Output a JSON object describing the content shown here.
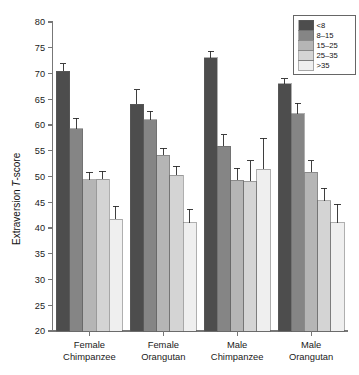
{
  "chart_data": {
    "type": "bar",
    "title": "",
    "subtitle": "",
    "xlabel": "",
    "ylabel": "Extraversion T-score",
    "ylabel_parts": {
      "prefix": "Extraversion ",
      "italic": "T",
      "suffix": "-score"
    },
    "ylim": [
      20,
      80
    ],
    "yticks": [
      20,
      25,
      30,
      35,
      40,
      45,
      50,
      55,
      60,
      65,
      70,
      75,
      80
    ],
    "ytick_labels": [
      "20",
      "25",
      "30",
      "35",
      "40",
      "45",
      "50",
      "55",
      "60",
      "65",
      "70",
      "75",
      "80"
    ],
    "grid": false,
    "legend_position": "top-right",
    "legend_title": "",
    "categories": [
      "Female Chimpanzee",
      "Female Orangutan",
      "Male Chimpanzee",
      "Male Orangutan"
    ],
    "category_lines": [
      [
        "Female",
        "Chimpanzee"
      ],
      [
        "Female",
        "Orangutan"
      ],
      [
        "Male",
        "Chimpanzee"
      ],
      [
        "Male",
        "Orangutan"
      ]
    ],
    "series": [
      {
        "name": "<8",
        "color": "#4d4d4d",
        "values": [
          70.4,
          64.0,
          73.1,
          68.0
        ],
        "err_upper": [
          1.5,
          2.8,
          1.2,
          1.0
        ],
        "err_lower": [
          0.0,
          0.0,
          0.0,
          0.0
        ]
      },
      {
        "name": "8–15",
        "color": "#858585",
        "values": [
          59.3,
          61.0,
          55.9,
          62.2
        ],
        "err_upper": [
          2.0,
          1.7,
          2.2,
          2.0
        ],
        "err_lower": [
          0.0,
          0.0,
          0.0,
          0.0
        ]
      },
      {
        "name": "15–25",
        "color": "#b5b5b5",
        "values": [
          49.4,
          54.1,
          49.3,
          50.8
        ],
        "err_upper": [
          1.4,
          1.4,
          2.3,
          2.3
        ],
        "err_lower": [
          0.0,
          0.0,
          0.0,
          0.0
        ]
      },
      {
        "name": "25–35",
        "color": "#d4d4d4",
        "values": [
          49.5,
          50.2,
          49.1,
          45.3
        ],
        "err_upper": [
          1.5,
          1.8,
          4.0,
          2.4
        ],
        "err_lower": [
          0.0,
          0.0,
          0.0,
          0.0
        ]
      },
      {
        "name": ">35",
        "color": "#efefef",
        "values": [
          41.7,
          41.0,
          51.4,
          41.0
        ],
        "err_upper": [
          2.5,
          2.6,
          6.0,
          3.6
        ],
        "err_lower": [
          0.0,
          0.0,
          0.0,
          0.0
        ]
      }
    ]
  },
  "legend": {
    "items": [
      {
        "label": "<8",
        "color": "#4d4d4d"
      },
      {
        "label": "8–15",
        "color": "#858585"
      },
      {
        "label": "15–25",
        "color": "#b5b5b5"
      },
      {
        "label": "25–35",
        "color": "#d4d4d4"
      },
      {
        "label": ">35",
        "color": "#efefef"
      }
    ]
  },
  "colors": {
    "background": "#ffffff",
    "axis": "#777777",
    "text": "#1a1a1a",
    "error_bar": "#2a2a2a"
  }
}
